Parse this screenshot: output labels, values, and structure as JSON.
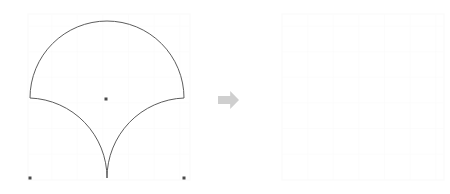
{
  "canvas": {
    "width": 450,
    "height": 194,
    "background_color": "#ffffff",
    "title": "Geometric shape dissection: source figure transformed to empty target grid"
  },
  "colors": {
    "stroke": "#4a4a4a",
    "grid_line": "#fbfbfb",
    "grid_line_major": "#f7f7f7",
    "dot_fill": "#4a4a4a",
    "arrow_fill": "#cfcfcf",
    "panel_background": "#ffffff"
  },
  "left_panel": {
    "name": "source-figure-panel",
    "bounds": {
      "x": 28,
      "y": 14,
      "width": 162,
      "height": 166
    },
    "grid": {
      "visible": true,
      "cell_size": 25.6,
      "columns": 6,
      "rows": 6,
      "color": "#fbfbfb"
    },
    "shape": {
      "name": "fan-shell-shape",
      "type": "circular-arc-polygon",
      "description": "Semicircular top arc with two concave circular arcs meeting at a downward cusp",
      "fill": "none",
      "stroke_width": 0.9,
      "vertices": {
        "left_shoulder": {
          "x": 30,
          "y": 98
        },
        "apex": {
          "x": 107,
          "y": 21
        },
        "right_shoulder": {
          "x": 184,
          "y": 98
        },
        "cusp": {
          "x": 107,
          "y": 178
        }
      },
      "arcs": [
        {
          "id": "top-semicircle",
          "from": "left_shoulder",
          "to": "right_shoulder",
          "radius": 77,
          "sweep": "clockwise-over-apex",
          "center": {
            "x": 107,
            "y": 98
          }
        },
        {
          "id": "lower-right-concave",
          "from": "right_shoulder",
          "to": "cusp",
          "radius": 80,
          "sweep": "concave-inward",
          "center": {
            "x": 184,
            "y": 178
          }
        },
        {
          "id": "lower-left-concave",
          "from": "cusp",
          "to": "left_shoulder",
          "radius": 80,
          "sweep": "concave-inward",
          "center": {
            "x": 30,
            "y": 178
          }
        }
      ]
    },
    "markers": [
      {
        "name": "center-dot",
        "x": 106,
        "y": 99,
        "size": 3
      },
      {
        "name": "bottom-left-dot",
        "x": 30,
        "y": 178,
        "size": 3
      },
      {
        "name": "bottom-right-dot",
        "x": 184,
        "y": 178,
        "size": 3
      }
    ]
  },
  "arrow": {
    "name": "transform-arrow",
    "direction": "right",
    "bounds": {
      "x": 218,
      "y": 91,
      "width": 21,
      "height": 18
    },
    "fill": "#cfcfcf"
  },
  "right_panel": {
    "name": "target-empty-panel",
    "bounds": {
      "x": 282,
      "y": 14,
      "width": 162,
      "height": 166
    },
    "grid": {
      "visible": true,
      "cell_size": 25.6,
      "columns": 6,
      "rows": 6,
      "color": "#fbfbfb"
    },
    "shape": null,
    "markers": []
  }
}
